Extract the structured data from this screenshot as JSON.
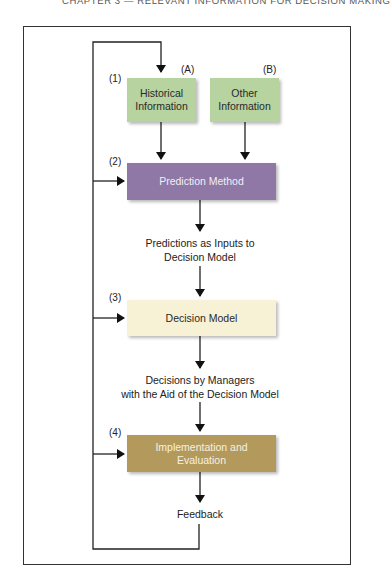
{
  "header": {
    "text": "CHAPTER 3  —  RELEVANT INFORMATION FOR DECISION MAKING"
  },
  "diagram": {
    "boxes": {
      "historical": {
        "step": "(1)",
        "letter": "(A)",
        "line1": "Historical",
        "line2": "Information",
        "color": "#b6d3a0"
      },
      "other": {
        "letter": "(B)",
        "line1": "Other",
        "line2": "Information",
        "color": "#b6d3a0"
      },
      "prediction": {
        "step": "(2)",
        "label": "Prediction Method",
        "color": "#8f78a6"
      },
      "decision_model": {
        "step": "(3)",
        "label": "Decision Model",
        "color": "#f7f1d6"
      },
      "implementation": {
        "step": "(4)",
        "line1": "Implementation and",
        "line2": "Evaluation",
        "color": "#b39a5c"
      }
    },
    "flow_labels": {
      "predictions_line1": "Predictions as Inputs to",
      "predictions_line2": "Decision Model",
      "decisions_line1": "Decisions by Managers",
      "decisions_line2": "with the Aid of the Decision Model",
      "feedback": "Feedback"
    }
  }
}
